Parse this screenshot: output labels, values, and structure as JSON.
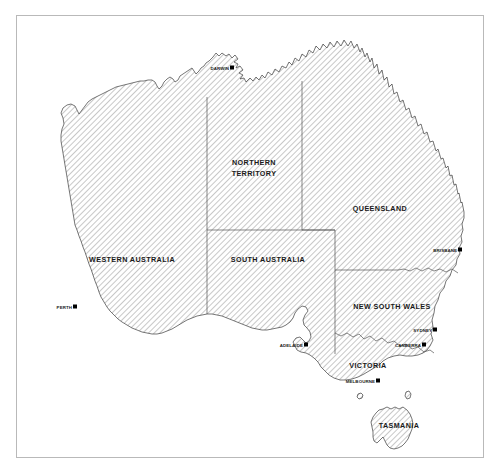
{
  "map": {
    "title": "Australia",
    "frame": {
      "visible": true,
      "border_color": "#b9b9b9"
    },
    "background_color": "#ffffff",
    "land_fill_style": "diagonal-hatch",
    "land_hatch_color": "#9a9a9a",
    "coastline_color": "#3c3c3c",
    "state_border_color": "#555555",
    "label_color": "#1a1a1a",
    "states": [
      {
        "id": "wa",
        "name": "WESTERN AUSTRALIA",
        "label_x": 132,
        "label_y": 262,
        "font_size": 7.2
      },
      {
        "id": "nt",
        "name_line1": "NORTHERN",
        "name_line2": "TERRITORY",
        "label_x": 254,
        "label_y": 167,
        "font_size": 7.2
      },
      {
        "id": "qld",
        "name": "QUEENSLAND",
        "label_x": 380,
        "label_y": 211,
        "font_size": 7.2
      },
      {
        "id": "sa",
        "name": "SOUTH AUSTRALIA",
        "label_x": 268,
        "label_y": 262,
        "font_size": 7.2
      },
      {
        "id": "nsw",
        "name": "NEW SOUTH WALES",
        "label_x": 392,
        "label_y": 309,
        "font_size": 7.2
      },
      {
        "id": "vic",
        "name": "VICTORIA",
        "label_x": 368,
        "label_y": 368,
        "font_size": 7.2
      },
      {
        "id": "tas",
        "name": "TASMANIA",
        "label_x": 399,
        "label_y": 428,
        "font_size": 7.2
      }
    ],
    "cities": [
      {
        "id": "darwin",
        "name": "DARWIN",
        "label_x": 229,
        "label_y": 70,
        "dot_x": 231.5,
        "dot_y": 68,
        "font_size": 4.4,
        "anchor": "end"
      },
      {
        "id": "perth",
        "name": "PERTH",
        "label_x": 72,
        "label_y": 309,
        "dot_x": 74.5,
        "dot_y": 307,
        "font_size": 4.4,
        "anchor": "end"
      },
      {
        "id": "adelaide",
        "name": "ADELAIDE",
        "label_x": 303,
        "label_y": 347,
        "dot_x": 305.5,
        "dot_y": 345,
        "font_size": 4.4,
        "anchor": "end"
      },
      {
        "id": "brisbane",
        "name": "BRISBANE",
        "label_x": 457,
        "label_y": 252,
        "dot_x": 459.5,
        "dot_y": 250,
        "font_size": 4.4,
        "anchor": "end"
      },
      {
        "id": "sydney",
        "name": "SYDNEY",
        "label_x": 432,
        "label_y": 332,
        "dot_x": 434.5,
        "dot_y": 330,
        "font_size": 4.4,
        "anchor": "end"
      },
      {
        "id": "canberra",
        "name": "CANBERRA",
        "label_x": 421,
        "label_y": 347,
        "dot_x": 423.5,
        "dot_y": 345,
        "font_size": 4.4,
        "anchor": "end"
      },
      {
        "id": "melbourne",
        "name": "MELBOURNE",
        "label_x": 375,
        "label_y": 383,
        "dot_x": 377.5,
        "dot_y": 381,
        "font_size": 4.4,
        "anchor": "end"
      }
    ]
  }
}
